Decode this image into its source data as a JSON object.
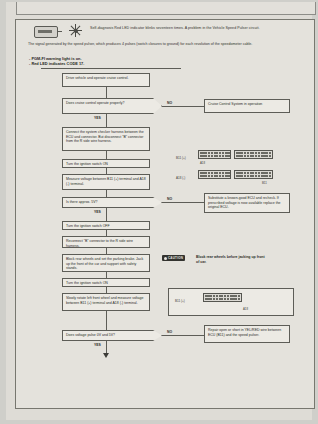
{
  "document": {
    "code_title": "Self-diagnosis Red LED indicator blinks seventeen times. A problem in the Vehicle Speed Pulser circuit.",
    "description": "The signal generated by the speed pulser, which produces 4 pulses (switch closures to ground) for each revolution of the speedometer cable.",
    "symptoms": [
      "- PGM-FI warning light is on.",
      "- Red LED indicates CODE 17."
    ],
    "icons": {
      "led": "led-indicator-icon",
      "lamp": "warning-lamp-icon"
    }
  },
  "flow": {
    "labels": {
      "yes": "YES",
      "no": "NO"
    },
    "steps": [
      {
        "id": "s1",
        "type": "box",
        "text": "Drive vehicle and operate cruise control."
      },
      {
        "id": "s2",
        "type": "decision",
        "text": "Does cruise control operate properly?"
      },
      {
        "id": "s3",
        "type": "box",
        "text": "Connect the system checker harness between the ECU and connector. But disconnect \"B\" connector from the R side wire harness."
      },
      {
        "id": "s4",
        "type": "box",
        "text": "Turn the ignition switch ON"
      },
      {
        "id": "s5",
        "type": "box",
        "text": "Measure voltage between B11 (+) terminal and A18 (-) terminal."
      },
      {
        "id": "s6",
        "type": "decision",
        "text": "Is there approx. 5V?"
      },
      {
        "id": "s7",
        "type": "box",
        "text": "Turn the ignition switch OFF"
      },
      {
        "id": "s8",
        "type": "box",
        "text": "Reconnect \"B\" connector to the R side wire harness."
      },
      {
        "id": "s9",
        "type": "box",
        "text": "Block rear wheels and set the parking brake. Jack up the front of the car and support with safety stands."
      },
      {
        "id": "s10",
        "type": "box",
        "text": "Turn the ignition switch ON"
      },
      {
        "id": "s11",
        "type": "box",
        "text": "Slowly rotate left front wheel and measure voltage between B11 (+) terminal and A18 (-) terminal."
      },
      {
        "id": "s12",
        "type": "decision",
        "text": "Does voltage pulse 0V and 5V?"
      }
    ],
    "branches": [
      {
        "id": "b1",
        "text": "Cruise Control System in operation"
      },
      {
        "id": "b2",
        "text": "Substitute a known-good ECU and recheck. If prescribed voltage is now available replace the original ECU."
      },
      {
        "id": "b3",
        "text": "Repair open or short in YEL/RED wire between ECU (B11) and the speed pulser."
      }
    ],
    "caution": {
      "badge": "CAUTION",
      "text": "Block rear wheels before jacking up front of car."
    }
  },
  "connectors": {
    "lead_label": "A18 (-)",
    "lead_label_alt": "B11 (+)",
    "cap_a": "A18",
    "cap_b": "B11",
    "diagrams": [
      {
        "id": "c1",
        "rows": 2,
        "cols": 11
      },
      {
        "id": "c2",
        "rows": 2,
        "cols": 13
      },
      {
        "id": "c3",
        "rows": 2,
        "cols": 11
      },
      {
        "id": "c4",
        "rows": 2,
        "cols": 13
      },
      {
        "id": "c5",
        "rows": 2,
        "cols": 13
      }
    ]
  },
  "colors": {
    "paper": "#e4e2dc",
    "ink": "#2b2b28",
    "line": "#5d5d57",
    "badge": "#33332f"
  }
}
